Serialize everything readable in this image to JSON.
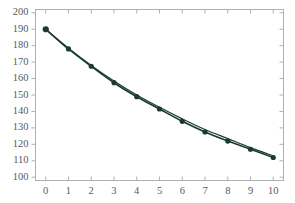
{
  "chart_data": {
    "type": "line",
    "title": "",
    "subtitle": "",
    "xlabel": "",
    "ylabel": "",
    "x": [
      0,
      1,
      2,
      3,
      4,
      5,
      6,
      7,
      8,
      9,
      10
    ],
    "categories": [
      0,
      1,
      2,
      3,
      4,
      5,
      6,
      7,
      8,
      9,
      10
    ],
    "series": [
      {
        "name": "data",
        "marker": "circle",
        "color": "#1b3a33",
        "values": [
          190,
          178,
          167.5,
          157.5,
          149,
          141.5,
          134,
          127.5,
          122,
          117,
          112
        ]
      },
      {
        "name": "fit",
        "marker": "none",
        "color": "#1b3a33",
        "values": [
          190,
          178.5,
          168,
          158.5,
          150,
          142.5,
          135.5,
          129,
          123.5,
          118,
          113
        ]
      }
    ],
    "xlim": [
      -0.45,
      10.45
    ],
    "ylim": [
      98,
      202
    ],
    "xticks": [
      0,
      1,
      2,
      3,
      4,
      5,
      6,
      7,
      8,
      9,
      10
    ],
    "yticks": [
      100,
      110,
      120,
      130,
      140,
      150,
      160,
      170,
      180,
      190,
      200
    ],
    "xtick_labels": [
      "0",
      "1",
      "2",
      "3",
      "4",
      "5",
      "6",
      "7",
      "8",
      "9",
      "10"
    ],
    "ytick_labels": [
      "100",
      "110",
      "120",
      "130",
      "140",
      "150",
      "160",
      "170",
      "180",
      "190",
      "200"
    ],
    "grid": false,
    "legend": null,
    "frame_color": "#b0b0b0",
    "tick_label_color": "#5a5a5a",
    "background": "#ffffff"
  }
}
